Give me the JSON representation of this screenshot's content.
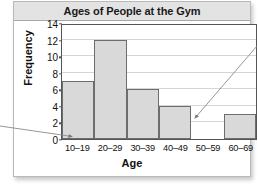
{
  "chart_data": {
    "type": "bar",
    "title": "Ages of People at the Gym",
    "xlabel": "Age",
    "ylabel": "Frequency",
    "categories": [
      "10–19",
      "20–29",
      "30–39",
      "40–49",
      "50–59",
      "60–69"
    ],
    "values": [
      7,
      12,
      6,
      4,
      0,
      3
    ],
    "ylim": [
      0,
      14
    ],
    "yticks": [
      0,
      2,
      4,
      6,
      8,
      10,
      12,
      14
    ],
    "ytick_labels": [
      "0",
      "2",
      "4",
      "6",
      "8",
      "10",
      "12",
      "14"
    ],
    "grid": true,
    "legend": false,
    "bar_fill_color": "#d9d9d9",
    "bar_border_color": "#6d6d6d",
    "annotations": [
      {
        "name": "left-arrow",
        "points_to": "10–19 bar baseline",
        "direction": "right"
      },
      {
        "name": "right-arrow",
        "points_to": "50–59 empty bin (frequency 0)",
        "direction": "down-left"
      }
    ]
  },
  "figure": {
    "title_band_color": "#e3e3e3"
  }
}
